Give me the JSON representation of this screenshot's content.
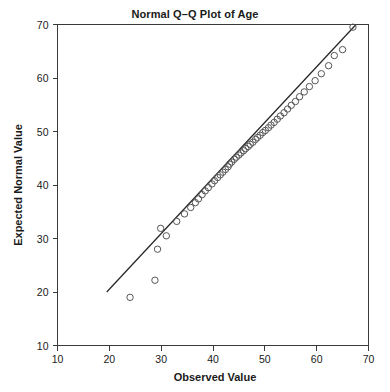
{
  "chart_data": {
    "type": "scatter",
    "title": "Normal Q–Q Plot of Age",
    "xlabel": "Observed Value",
    "ylabel": "Expected Normal Value",
    "xlim": [
      10,
      70
    ],
    "ylim": [
      10,
      70
    ],
    "xticks": [
      10,
      20,
      30,
      40,
      50,
      60,
      70
    ],
    "yticks": [
      10,
      20,
      30,
      40,
      50,
      60,
      70
    ],
    "xtick_labels": [
      "10",
      "20",
      "30",
      "40",
      "50",
      "60",
      "70"
    ],
    "ytick_labels": [
      "10",
      "20",
      "30",
      "40",
      "50",
      "60",
      "70"
    ],
    "grid": false,
    "legend": false,
    "marker": "open-circle",
    "marker_size": 4,
    "point_color": "#555555",
    "line_color": "#262626",
    "reference_line": {
      "label": "normal reference line",
      "x_start": 19.5,
      "y_start": 20.0,
      "x_end": 67.6,
      "y_end": 70.0
    },
    "series": [
      {
        "name": "Age",
        "points": [
          [
            24.0,
            19.0
          ],
          [
            28.8,
            22.2
          ],
          [
            29.3,
            28.0
          ],
          [
            29.9,
            31.9
          ],
          [
            31.0,
            30.5
          ],
          [
            33.0,
            33.2
          ],
          [
            34.5,
            34.6
          ],
          [
            35.7,
            35.8
          ],
          [
            36.6,
            36.7
          ],
          [
            37.2,
            37.4
          ],
          [
            37.9,
            38.2
          ],
          [
            38.5,
            38.9
          ],
          [
            39.1,
            39.5
          ],
          [
            39.8,
            40.2
          ],
          [
            40.3,
            40.8
          ],
          [
            40.9,
            41.4
          ],
          [
            41.4,
            41.9
          ],
          [
            41.9,
            42.4
          ],
          [
            42.4,
            42.9
          ],
          [
            42.9,
            43.4
          ],
          [
            43.2,
            43.9
          ],
          [
            43.6,
            44.3
          ],
          [
            44.1,
            44.8
          ],
          [
            44.5,
            45.2
          ],
          [
            45.0,
            45.6
          ],
          [
            45.4,
            46.0
          ],
          [
            45.9,
            46.4
          ],
          [
            46.3,
            46.8
          ],
          [
            46.8,
            47.2
          ],
          [
            47.2,
            47.6
          ],
          [
            47.7,
            48.0
          ],
          [
            48.2,
            48.5
          ],
          [
            48.6,
            48.9
          ],
          [
            49.1,
            49.3
          ],
          [
            49.6,
            49.8
          ],
          [
            50.1,
            50.2
          ],
          [
            50.7,
            50.7
          ],
          [
            51.2,
            51.2
          ],
          [
            51.8,
            51.7
          ],
          [
            52.4,
            52.3
          ],
          [
            53.0,
            52.9
          ],
          [
            53.7,
            53.5
          ],
          [
            54.4,
            54.2
          ],
          [
            55.1,
            54.9
          ],
          [
            55.9,
            55.6
          ],
          [
            56.7,
            56.5
          ],
          [
            57.6,
            57.4
          ],
          [
            58.6,
            58.4
          ],
          [
            59.7,
            59.5
          ],
          [
            60.9,
            60.8
          ],
          [
            62.3,
            62.3
          ],
          [
            63.4,
            64.2
          ],
          [
            65.0,
            65.3
          ],
          [
            67.0,
            69.5
          ]
        ]
      }
    ]
  }
}
